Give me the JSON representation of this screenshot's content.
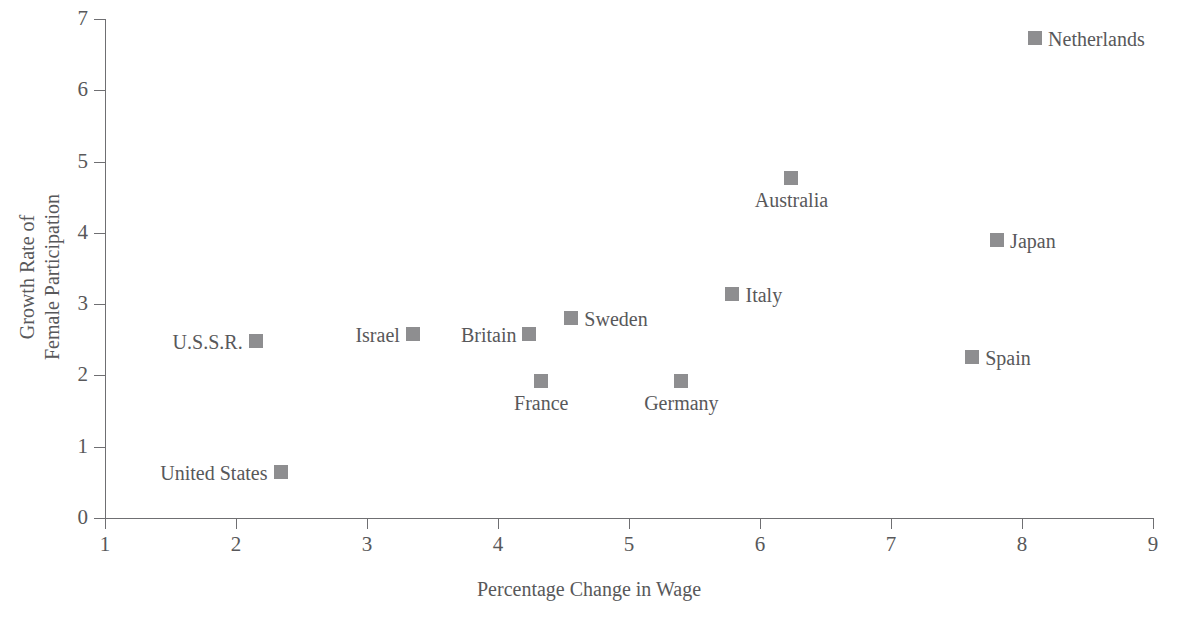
{
  "chart_data": {
    "type": "scatter",
    "title": "",
    "xlabel": "Percentage Change in Wage",
    "ylabel": "Growth Rate of\nFemale Participation",
    "xlim": [
      1,
      9
    ],
    "ylim": [
      0,
      7
    ],
    "xticks": [
      1,
      2,
      3,
      4,
      5,
      6,
      7,
      8,
      9
    ],
    "yticks": [
      0,
      1,
      2,
      3,
      4,
      5,
      6,
      7
    ],
    "grid": false,
    "legend": "none",
    "marker_color": "#8e8e90",
    "axis_color": "#6f6f72",
    "text_color": "#58585a",
    "points": [
      {
        "label": "Netherlands",
        "x": 8.1,
        "y": 6.73,
        "label_pos": "right"
      },
      {
        "label": "Australia",
        "x": 6.24,
        "y": 4.77,
        "label_pos": "below"
      },
      {
        "label": "Japan",
        "x": 7.81,
        "y": 3.9,
        "label_pos": "right"
      },
      {
        "label": "Italy",
        "x": 5.79,
        "y": 3.14,
        "label_pos": "right"
      },
      {
        "label": "Sweden",
        "x": 4.56,
        "y": 2.81,
        "label_pos": "right"
      },
      {
        "label": "Israel",
        "x": 3.35,
        "y": 2.58,
        "label_pos": "left"
      },
      {
        "label": "Britain",
        "x": 4.24,
        "y": 2.58,
        "label_pos": "left"
      },
      {
        "label": "U.S.S.R.",
        "x": 2.15,
        "y": 2.48,
        "label_pos": "left"
      },
      {
        "label": "Spain",
        "x": 7.62,
        "y": 2.26,
        "label_pos": "right"
      },
      {
        "label": "France",
        "x": 4.33,
        "y": 1.92,
        "label_pos": "below"
      },
      {
        "label": "Germany",
        "x": 5.4,
        "y": 1.92,
        "label_pos": "below"
      },
      {
        "label": "United States",
        "x": 2.34,
        "y": 0.65,
        "label_pos": "left"
      }
    ]
  }
}
